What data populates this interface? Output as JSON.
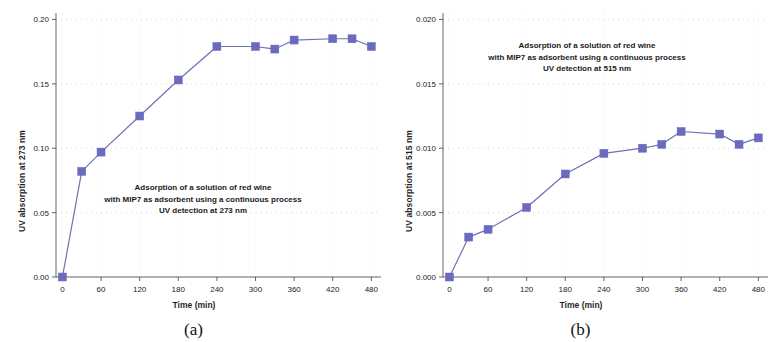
{
  "figure": {
    "panels": [
      {
        "sublabel": "(a)",
        "annotation_line1": "Adsorption of a solution of red wine",
        "annotation_line2": "with MIP7 as adsorbent using a continuous process",
        "annotation_line3": "UV detection at 273 nm"
      },
      {
        "sublabel": "(b)",
        "annotation_line1": "Adsorption of a solution of red wine",
        "annotation_line2": "with MIP7 as adsorbent using a continuous process",
        "annotation_line3": "UV detection at 515 nm"
      }
    ],
    "marker_color": "#6a6abf",
    "line_color": "#6f6fb4"
  },
  "chart_data": [
    {
      "type": "line",
      "panel": "(a)",
      "title": "Adsorption of a solution of red wine with MIP7 as adsorbent using a continuous process UV detection at 273 nm",
      "xlabel": "Time (min)",
      "ylabel": "UV absorption at 273 nm",
      "xlim": [
        -10,
        495
      ],
      "ylim": [
        0.0,
        0.205
      ],
      "xticks": [
        0,
        60,
        120,
        180,
        240,
        300,
        360,
        420,
        480
      ],
      "xticklabels": [
        "0",
        "60",
        "120",
        "180",
        "240",
        "300",
        "360",
        "420",
        "480"
      ],
      "yticks": [
        0.0,
        0.05,
        0.1,
        0.15,
        0.2
      ],
      "yticklabels": [
        "0.00",
        "0.05",
        "0.10",
        "0.15",
        "0.20"
      ],
      "grid": true,
      "legend": "none",
      "x": [
        0,
        30,
        60,
        120,
        180,
        240,
        300,
        330,
        360,
        420,
        450,
        480
      ],
      "y": [
        0.0,
        0.082,
        0.097,
        0.125,
        0.153,
        0.179,
        0.179,
        0.177,
        0.184,
        0.185,
        0.185,
        0.179
      ]
    },
    {
      "type": "line",
      "panel": "(b)",
      "title": "Adsorption of a solution of red wine with MIP7 as adsorbent using a continuous process UV detection at 515 nm",
      "xlabel": "Time (min)",
      "ylabel": "UV absorption at 515 nm",
      "xlim": [
        -10,
        495
      ],
      "ylim": [
        0.0,
        0.0205
      ],
      "xticks": [
        0,
        60,
        120,
        180,
        240,
        300,
        360,
        420,
        480
      ],
      "xticklabels": [
        "0",
        "60",
        "120",
        "180",
        "240",
        "300",
        "360",
        "420",
        "480"
      ],
      "yticks": [
        0.0,
        0.005,
        0.01,
        0.015,
        0.02
      ],
      "yticklabels": [
        "0.000",
        "0.005",
        "0.010",
        "0.015",
        "0.020"
      ],
      "grid": true,
      "legend": "none",
      "x": [
        0,
        30,
        60,
        120,
        180,
        240,
        300,
        330,
        360,
        420,
        450,
        480
      ],
      "y": [
        0.0,
        0.0031,
        0.0037,
        0.0054,
        0.008,
        0.0096,
        0.01,
        0.0103,
        0.0113,
        0.0111,
        0.0103,
        0.0108
      ]
    }
  ]
}
